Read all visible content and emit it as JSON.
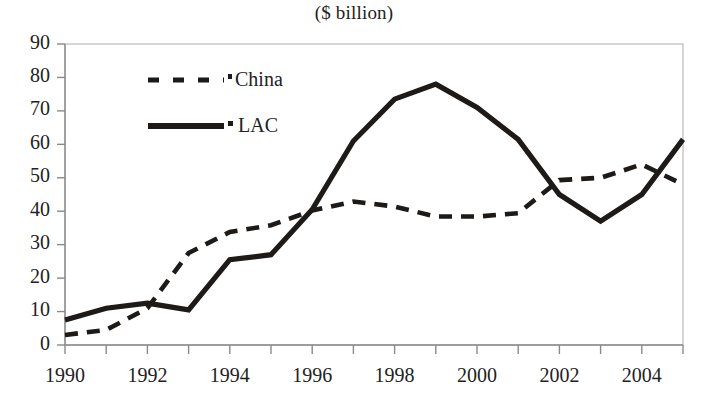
{
  "chart_data": {
    "type": "line",
    "title": "($ billion)",
    "xlabel": "",
    "ylabel": "",
    "x": [
      1990,
      1991,
      1992,
      1993,
      1994,
      1995,
      1996,
      1997,
      1998,
      1999,
      2000,
      2001,
      2002,
      2003,
      2004,
      2005
    ],
    "xlim": [
      1990,
      2005
    ],
    "ylim": [
      0,
      90
    ],
    "ytick_labels": [
      "0",
      "10",
      "20",
      "30",
      "40",
      "50",
      "60",
      "70",
      "80",
      "90"
    ],
    "ytick_values": [
      0,
      10,
      20,
      30,
      40,
      50,
      60,
      70,
      80,
      90
    ],
    "xtick_labels": [
      "1990",
      "1992",
      "1994",
      "1996",
      "1998",
      "2000",
      "2002",
      "2004"
    ],
    "xtick_values": [
      1990,
      1992,
      1994,
      1996,
      1998,
      2000,
      2002,
      2004
    ],
    "grid": false,
    "legend_position": "upper-left-inside",
    "series": [
      {
        "name": "China",
        "style": "dashed",
        "color": "#1d1a18",
        "values": [
          3,
          4.5,
          11,
          27.5,
          33.8,
          35.8,
          40.2,
          42.9,
          41.4,
          38.4,
          38.4,
          39.4,
          49.3,
          50,
          54,
          48
        ]
      },
      {
        "name": "LAC",
        "style": "solid",
        "color": "#1d1a18",
        "values": [
          7.5,
          11,
          12.5,
          10.5,
          25.5,
          27,
          40.5,
          61,
          73.5,
          78,
          71,
          61.5,
          45,
          37,
          45,
          61.5
        ]
      }
    ]
  },
  "legend": {
    "entries": [
      {
        "label": "China",
        "marker": "dashed-line-swatch"
      },
      {
        "label": "LAC",
        "marker": "solid-line-swatch"
      }
    ]
  },
  "colors": {
    "ink": "#1d1a18",
    "axis": "#8a8a8a",
    "frame": "#b9b9b9",
    "background": "#ffffff"
  }
}
